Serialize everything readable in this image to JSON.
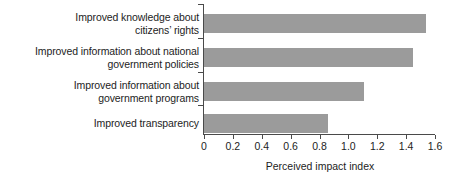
{
  "chart_data": {
    "type": "bar",
    "orientation": "horizontal",
    "title": "",
    "xlabel": "Perceived impact index",
    "ylabel": "",
    "categories": [
      "Improved knowledge about\ncitizens’ rights",
      "Improved information about national\ngovernment policies",
      "Improved information about\ngovernment programs",
      "Improved transparency"
    ],
    "values": [
      1.54,
      1.45,
      1.11,
      0.86
    ],
    "xlim": [
      0,
      1.6
    ],
    "xticks": [
      0,
      0.2,
      0.4,
      0.6,
      0.8,
      1.0,
      1.2,
      1.4,
      1.6
    ],
    "xticklabels": [
      "0",
      "0.2",
      "0.4",
      "0.6",
      "0.8",
      "1.0",
      "1.2",
      "1.4",
      "1.6"
    ],
    "grid": false,
    "legend": null,
    "bar_color": "#9b9b9b",
    "axis_color": "#4a4a4a",
    "text_color": "#1d1d1d"
  }
}
